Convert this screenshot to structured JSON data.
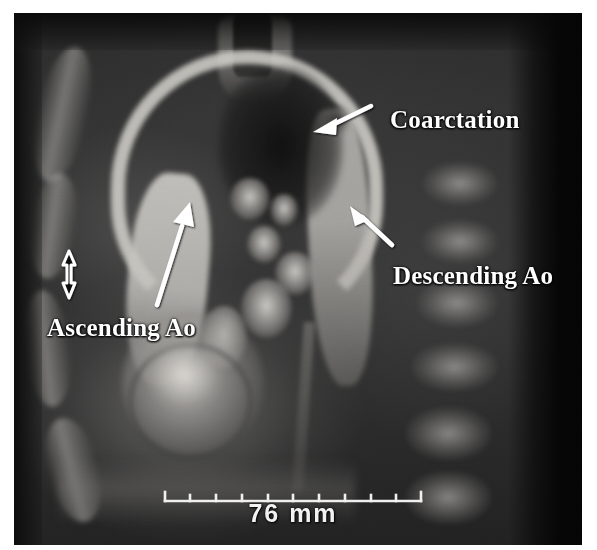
{
  "image": {
    "modality_appearance": "grayscale-mri-slice",
    "background_color": "#ffffff",
    "field_color": "#2e2e2e"
  },
  "annotations": {
    "labels": [
      {
        "id": "coarctation",
        "text": "Coarctation"
      },
      {
        "id": "descending-ao",
        "text": "Descending Ao"
      },
      {
        "id": "ascending-ao",
        "text": "Ascending Ao"
      }
    ],
    "arrows": [
      {
        "id": "coarctation-arrow",
        "points_to": "coarctation",
        "direction": "down-left",
        "color": "#ffffff"
      },
      {
        "id": "descending-ao-arrow",
        "points_to": "descending-ao",
        "direction": "up-left",
        "color": "#ffffff"
      },
      {
        "id": "ascending-ao-arrow",
        "points_to": "ascending-ao",
        "direction": "up-right",
        "color": "#ffffff"
      }
    ],
    "measure_marker": {
      "id": "vertical-double-arrow",
      "orientation": "vertical",
      "style": "double-headed-outline",
      "outline_color": "#ffffff",
      "fill_color": "#0c0c0c"
    }
  },
  "scale_bar": {
    "label": "76 mm",
    "value": 76,
    "unit": "mm",
    "tick_count": 11,
    "color": "#f2f2f2"
  }
}
